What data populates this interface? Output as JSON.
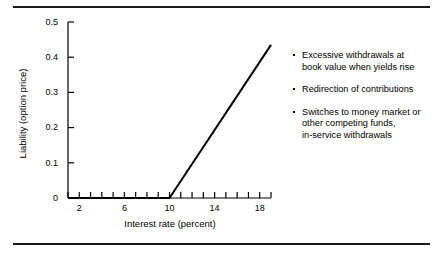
{
  "figure": {
    "top_rule": "horizontal-rule",
    "bottom_rule": "horizontal-rule"
  },
  "chart_data": {
    "type": "line",
    "title": "",
    "subtitle": "",
    "xlabel": "Interest rate (percent)",
    "ylabel": "Liability (option price)",
    "xlim": [
      1,
      19
    ],
    "ylim": [
      0,
      0.5
    ],
    "grid": false,
    "legend_position": "none",
    "x_major_ticks": [
      2,
      6,
      10,
      14,
      18
    ],
    "x_major_tick_labels": [
      "2",
      "6",
      "10",
      "14",
      "18"
    ],
    "x_minor_tick_step": 1,
    "y_ticks": [
      0,
      0.1,
      0.2,
      0.3,
      0.4,
      0.5
    ],
    "y_tick_labels": [
      "0",
      "0.1",
      "0.2",
      "0.3",
      "0.4",
      "0.5"
    ],
    "series": [
      {
        "name": "Liability (option price)",
        "color": "#000000",
        "line_width": 2,
        "x": [
          1,
          10,
          19
        ],
        "values": [
          0,
          0,
          0.435
        ]
      }
    ],
    "annotations": {
      "kink_x": 10,
      "kink_y": 0,
      "endpoint_x": 19,
      "endpoint_y": 0.435
    }
  },
  "notes": {
    "bullets": [
      {
        "lines": [
          "Excessive withdrawals at",
          "book value when yields rise"
        ]
      },
      {
        "lines": [
          "Redirection of contributions"
        ]
      },
      {
        "lines": [
          "Switches to money market or",
          "other competing funds,",
          "in-service withdrawals"
        ]
      }
    ]
  },
  "colors": {
    "ink": "#000000",
    "rule": "#1a1a1a",
    "background": "#ffffff"
  }
}
